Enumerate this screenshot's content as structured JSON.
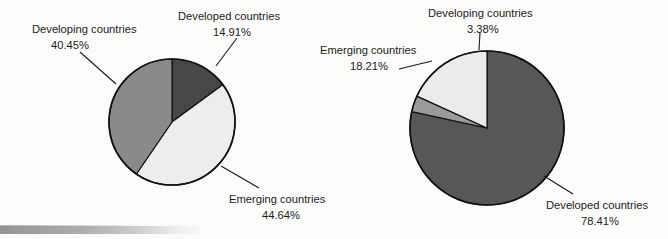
{
  "figure": {
    "background_color": "#fbfbfa",
    "outline_color": "#111111",
    "leader_line_color": "#1a1a1a",
    "text_color": "#1c1c1c",
    "scan_artifact": "gray gradient bar along bottom-left edge"
  },
  "chart_data": [
    {
      "type": "pie",
      "name": "left-pie-chart",
      "title": "",
      "labels": [
        "Developed countries",
        "Emerging countries",
        "Developing countries"
      ],
      "values": [
        14.91,
        44.64,
        40.45
      ],
      "value_labels": [
        "14.91%",
        "44.64%",
        "40.45%"
      ],
      "colors": [
        "#474747",
        "#ededed",
        "#8a8a8a"
      ],
      "start_angle": 0,
      "direction": "clockwise",
      "center": [
        172,
        122
      ],
      "radius": 63,
      "legend": "callout labels with leader lines",
      "annotations": [
        {
          "label": "Developing countries",
          "value": "40.45%",
          "position": "upper-left"
        },
        {
          "label": "Developed countries",
          "value": "14.91%",
          "position": "top-right"
        },
        {
          "label": "Emerging countries",
          "value": "44.64%",
          "position": "lower-right"
        }
      ]
    },
    {
      "type": "pie",
      "name": "right-pie-chart",
      "title": "",
      "labels": [
        "Developed countries",
        "Developing countries",
        "Emerging countries"
      ],
      "values": [
        78.41,
        3.38,
        18.21
      ],
      "value_labels": [
        "78.41%",
        "3.38%",
        "18.21%"
      ],
      "colors": [
        "#575757",
        "#9a9a9a",
        "#ebebeb"
      ],
      "start_angle": 0,
      "direction": "clockwise",
      "center": [
        487,
        128
      ],
      "radius": 77,
      "legend": "callout labels with leader lines",
      "annotations": [
        {
          "label": "Developing countries",
          "value": "3.38%",
          "position": "top"
        },
        {
          "label": "Emerging countries",
          "value": "18.21%",
          "position": "upper-left"
        },
        {
          "label": "Developed countries",
          "value": "78.41%",
          "position": "lower-right"
        }
      ]
    }
  ],
  "left_chart": {
    "developing": {
      "label": "Developing countries",
      "value": "40.45%"
    },
    "developed": {
      "label": "Developed countries",
      "value": "14.91%"
    },
    "emerging": {
      "label": "Emerging countries",
      "value": "44.64%"
    }
  },
  "right_chart": {
    "developing": {
      "label": "Developing countries",
      "value": "3.38%"
    },
    "emerging": {
      "label": "Emerging countries",
      "value": "18.21%"
    },
    "developed": {
      "label": "Developed countries",
      "value": "78.41%"
    }
  }
}
